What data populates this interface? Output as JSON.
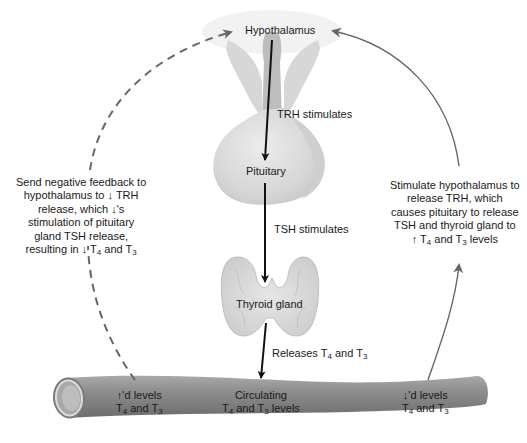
{
  "organs": {
    "hypothalamus": "Hypothalamus",
    "pituitary": "Pituitary",
    "thyroid": "Thyroid gland"
  },
  "arrows": {
    "trh": "TRH stimulates",
    "tsh": "TSH stimulates",
    "releases": {
      "prefix": "Releases T",
      "sub1": "4",
      "mid": " and T",
      "sub2": "3"
    }
  },
  "vessel": {
    "left": {
      "line1": "↑'d levels",
      "prefix": "T",
      "sub1": "4",
      "mid": " and T",
      "sub2": "3"
    },
    "center": {
      "line1": "Circulating",
      "prefix": "T",
      "sub1": "4",
      "mid": " and T",
      "sub2": "3",
      "suffix": " levels"
    },
    "right": {
      "line1": "↓'d levels",
      "prefix": "T",
      "sub1": "4",
      "mid": " and T",
      "sub2": "3"
    }
  },
  "feedback": {
    "negative": {
      "lines": [
        "Send negative feedback to",
        "hypothalamus to ↓ TRH",
        "release, which ↓'s",
        "stimulation of pituitary",
        "gland TSH release,"
      ],
      "last_prefix": "resulting in ↓ T",
      "last_sub1": "4",
      "last_mid": " and T",
      "last_sub2": "3"
    },
    "positive": {
      "lines": [
        "Stimulate hypothalamus to",
        "release TRH, which",
        "causes pituitary to release",
        "TSH and thyroid gland to"
      ],
      "last_prefix": "↑ T",
      "last_sub1": "4",
      "last_mid": " and T",
      "last_sub2": "3",
      "last_suffix": " levels"
    }
  },
  "colors": {
    "organ_fill": "#d9d9d9",
    "organ_shade": "#bcbcbc",
    "vessel": "#8a8a8a",
    "feedback_arrow": "#666666",
    "main_arrow": "#111111"
  }
}
